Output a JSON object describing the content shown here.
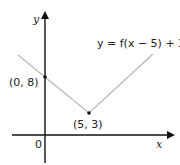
{
  "diagram": {
    "axes": {
      "x_label": "x",
      "y_label": "y",
      "origin_label": "0"
    },
    "curve_label": "y = f(x − 5) + 3",
    "points": [
      {
        "label": "(0, 8)",
        "x": 0,
        "y": 8
      },
      {
        "label": "(5, 3)",
        "x": 5,
        "y": 3
      }
    ],
    "colors": {
      "axes": "#111111",
      "curve": "#b8b8b8",
      "points": "#111111"
    }
  }
}
